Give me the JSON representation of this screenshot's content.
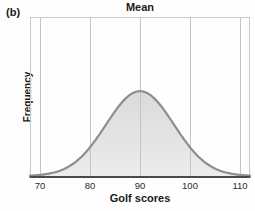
{
  "panel_label": "(b)",
  "chart_data": {
    "type": "area",
    "title": "Mean",
    "title_position_x": 90,
    "xlabel": "Golf scores",
    "ylabel": "Frequency",
    "x_ticks": [
      70,
      80,
      90,
      100,
      110
    ],
    "xlim": [
      68,
      112
    ],
    "grid": "vertical-at-ticks",
    "legend": "none",
    "distribution": {
      "shape": "normal",
      "mean": 90,
      "sd": 6.8,
      "peak_relative_height": 0.53
    },
    "colors": {
      "curve_stroke": "#8e8e8e",
      "fill_top": "#dadada",
      "fill_bottom": "#ececec",
      "grid_line": "#c4c4c4",
      "plot_border": "#c8c8c8",
      "x_axis_line": "#4a4a4a",
      "text": "#1a1a1a",
      "background": "#fefefe"
    }
  }
}
